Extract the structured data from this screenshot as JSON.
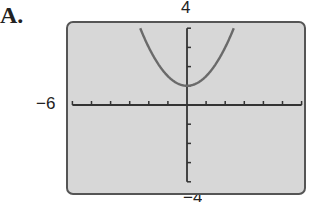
{
  "figure_label": "A.",
  "axis_labels": {
    "y_max": "4",
    "x_min": "−6",
    "y_min": "−4"
  },
  "colors": {
    "screen_bg": "#d7d7d7",
    "border": "#555555",
    "axis": "#333333",
    "curve": "#6a6a6a"
  },
  "chart_data": {
    "type": "line",
    "title": "",
    "xlabel": "",
    "ylabel": "",
    "xlim": [
      -6,
      6
    ],
    "ylim": [
      -4,
      4
    ],
    "x_scale": 1,
    "y_scale": 1,
    "grid": false,
    "tick_labels": {
      "x_min": "−6",
      "y_max": "4",
      "y_min": "−4"
    },
    "series": [
      {
        "name": "parabola",
        "equation": "y = 0.5x^2 + 1",
        "x": [
          -2.45,
          -2,
          -1.5,
          -1,
          -0.5,
          0,
          0.5,
          1,
          1.5,
          2,
          2.45
        ],
        "y": [
          4,
          3,
          2.125,
          1.5,
          1.125,
          1,
          1.125,
          1.5,
          2.125,
          3,
          4
        ]
      }
    ],
    "vertex": [
      0,
      1
    ]
  }
}
